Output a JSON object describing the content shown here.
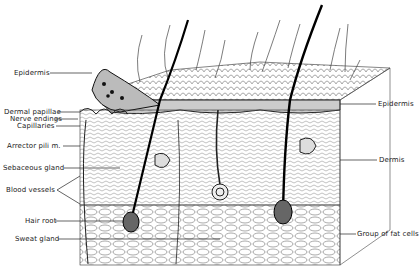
{
  "labels_left": [
    {
      "id": "epidermis-left",
      "text": "Epidermis"
    },
    {
      "id": "dermal-papillae",
      "text": "Dermal papillae"
    },
    {
      "id": "nerve-endings",
      "text": "Nerve endings"
    },
    {
      "id": "capillaries",
      "text": "Capillaries"
    },
    {
      "id": "arrector-pili",
      "text": "Arrector pili m."
    },
    {
      "id": "sebaceous-gland",
      "text": "Sebaceous gland"
    },
    {
      "id": "blood-vessels",
      "text": "Blood vessels"
    },
    {
      "id": "hair-root",
      "text": "Hair root"
    },
    {
      "id": "sweat-gland",
      "text": "Sweat gland"
    }
  ],
  "labels_right": [
    {
      "id": "epidermis-right",
      "text": "Epidermis"
    },
    {
      "id": "dermis",
      "text": "Dermis"
    },
    {
      "id": "fat-cells",
      "text": "Group of fat cells"
    }
  ]
}
